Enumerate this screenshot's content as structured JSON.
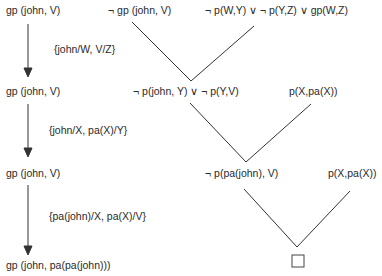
{
  "goal_column": {
    "steps": [
      "gp (john, V)",
      "gp (john, V)",
      "gp (john, V)",
      "gp (john, V)",
      "gp (john, pa(pa(john)))"
    ],
    "substitutions": [
      "{john/W, V/Z}",
      "{john/X, pa(X)/Y}",
      "{pa(john)/X, pa(X)/V}"
    ]
  },
  "resolution": {
    "row1": {
      "left": "¬ gp (john, V)",
      "right": "¬ p(W,Y) ∨ ¬ p(Y,Z) ∨ gp(W,Z)"
    },
    "row2": {
      "left": "¬ p(john, Y) ∨ ¬ p(Y,V)",
      "right": "p(X,pa(X))"
    },
    "row3": {
      "left": "¬ p(pa(john), V)",
      "right": "p(X,pa(X))"
    },
    "empty_clause": "□"
  }
}
